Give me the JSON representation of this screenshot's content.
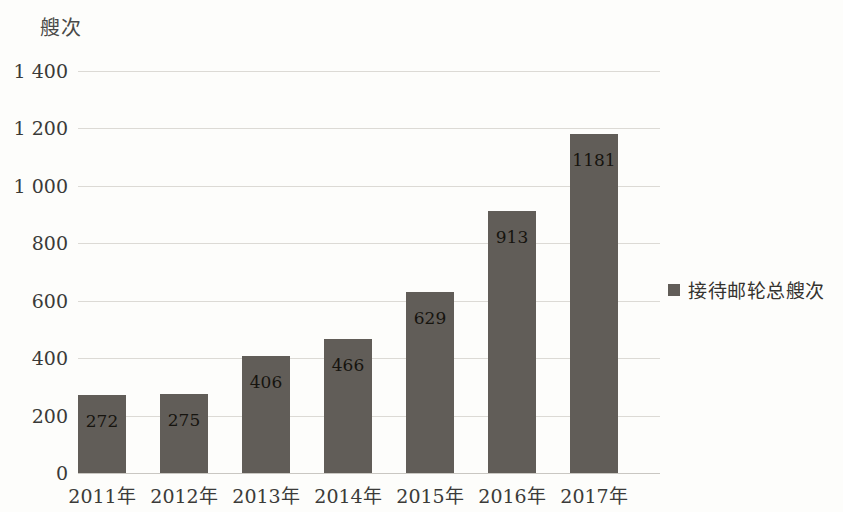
{
  "chart_data": {
    "type": "bar",
    "title": "",
    "subtitle": "",
    "xlabel": "",
    "ylabel": "艘次",
    "categories": [
      "2011年",
      "2012年",
      "2013年",
      "2014年",
      "2015年",
      "2016年",
      "2017年"
    ],
    "values": [
      272,
      275,
      406,
      466,
      629,
      913,
      1181
    ],
    "data_labels": [
      "272",
      "275",
      "406",
      "466",
      "629",
      "913",
      "1181"
    ],
    "series": [
      {
        "name": "接待邮轮总艘次",
        "values": [
          272,
          275,
          406,
          466,
          629,
          913,
          1181
        ],
        "color": "#615d58"
      }
    ],
    "ylim": [
      0,
      1400
    ],
    "y_ticks": [
      0,
      200,
      400,
      600,
      800,
      1000,
      1200,
      1400
    ],
    "y_tick_labels": [
      "0",
      "200",
      "400",
      "600",
      "800",
      "1 000",
      "1 200",
      "1 400"
    ],
    "grid": true,
    "grid_axis": "y",
    "legend": {
      "position": "right",
      "entries": [
        {
          "label": "接待邮轮总艘次",
          "marker": "square",
          "color": "#615d58"
        }
      ]
    },
    "colors": {
      "background": "#fdfdfb",
      "bar": "#615d58",
      "gridline": "#dcdad5",
      "text": "#3a3a38",
      "data_label": "#16140f"
    }
  },
  "legend": {
    "marker_icon": "square-marker-icon",
    "label": "接待邮轮总艘次"
  },
  "axes": {
    "y_title": "艘次"
  }
}
